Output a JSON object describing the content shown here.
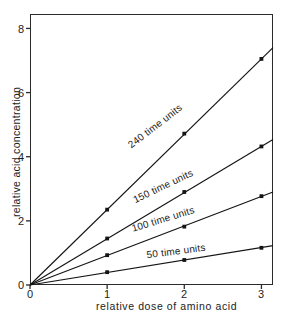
{
  "chart_data": {
    "type": "line",
    "title": "",
    "subtitle": "",
    "xlabel": "relative dose of amino acid",
    "ylabel": "relative acid concentration",
    "xlim": [
      0,
      3.15
    ],
    "ylim": [
      0,
      8.45
    ],
    "xticks": [
      "0",
      "1",
      "2",
      "3"
    ],
    "xtick_values": [
      0,
      1,
      2,
      3
    ],
    "yticks": [
      "0",
      "2",
      "4",
      "6",
      "8"
    ],
    "ytick_values": [
      0,
      2,
      4,
      6,
      8
    ],
    "grid": false,
    "legend": "inline-along-lines",
    "x": [
      0,
      1,
      2,
      3
    ],
    "series": [
      {
        "name": "240 time units",
        "label": "240 time units",
        "values": [
          0,
          2.35,
          4.72,
          7.05
        ],
        "slope": 2.35,
        "color": "#141414",
        "marker": "square",
        "label_angle_deg": -37.6,
        "label_x": 155,
        "label_y": 126
      },
      {
        "name": "150 time units",
        "label": "150 time units",
        "values": [
          0,
          1.45,
          2.9,
          4.32
        ],
        "slope": 1.44,
        "color": "#141414",
        "marker": "square",
        "label_angle_deg": -25.5,
        "label_x": 163,
        "label_y": 186
      },
      {
        "name": "100 time units",
        "label": "100 time units",
        "values": [
          0,
          0.93,
          1.82,
          2.77
        ],
        "slope": 0.92,
        "color": "#141414",
        "marker": "square",
        "label_angle_deg": -17.0,
        "label_x": 163,
        "label_y": 219
      },
      {
        "name": "50 time units",
        "label": "50 time units",
        "values": [
          0,
          0.4,
          0.78,
          1.16
        ],
        "slope": 0.39,
        "color": "#141414",
        "marker": "square",
        "label_angle_deg": -7.5,
        "label_x": 176,
        "label_y": 251
      }
    ]
  },
  "axes": {
    "x": {
      "title": "relative dose of amino acid",
      "ticks": [
        "0",
        "1",
        "2",
        "3"
      ]
    },
    "y": {
      "title": "relative acid concentration",
      "ticks": [
        "0",
        "2",
        "4",
        "6",
        "8"
      ]
    }
  },
  "style": {
    "background": "#ffffff",
    "frame_color": "#2b2b2b",
    "line_color": "#141414",
    "text_color": "#1c1c1c"
  }
}
